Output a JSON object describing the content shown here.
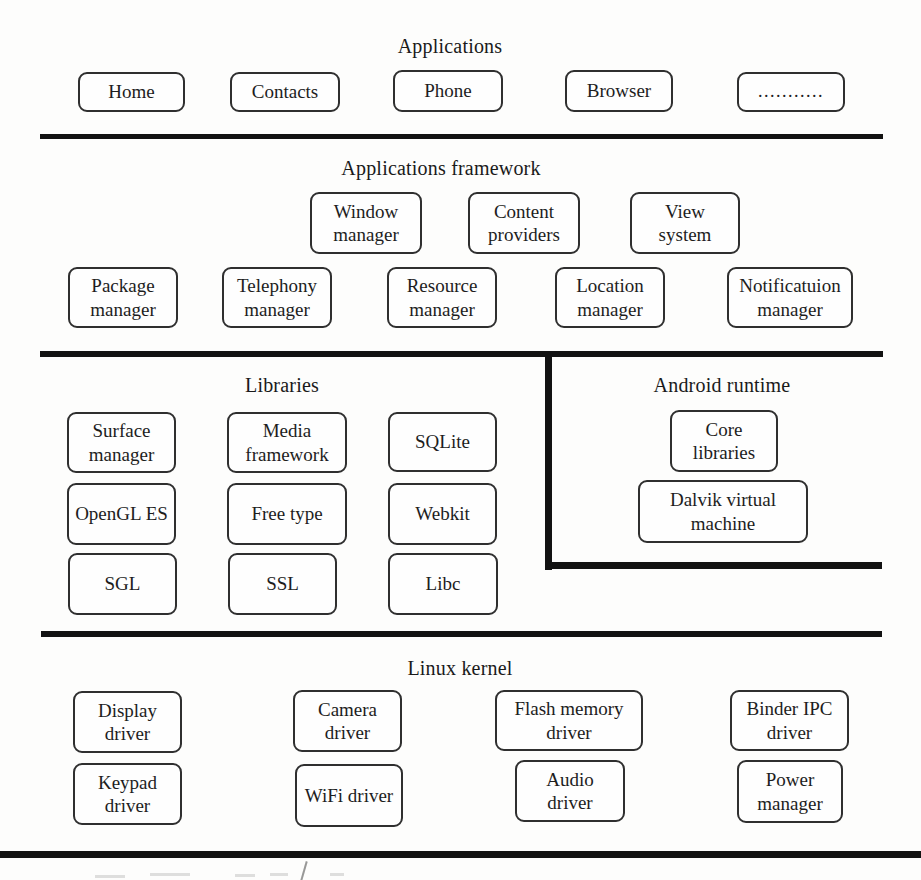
{
  "figure": {
    "type": "android-architecture-stack-diagram",
    "background_color": "#fdfdfc",
    "line_color": "#121212",
    "box_border_color": "#2f2f2f",
    "text_color": "#1d1d1d"
  },
  "sections": {
    "applications": {
      "title": "Applications",
      "boxes": [
        "Home",
        "Contacts",
        "Phone",
        "Browser",
        "..........."
      ]
    },
    "applications_framework": {
      "title": "Applications framework",
      "row1": [
        "Window manager",
        "Content providers",
        "View system"
      ],
      "row2": [
        "Package manager",
        "Telephony manager",
        "Resource manager",
        "Location manager",
        "Notificatuion manager"
      ]
    },
    "libraries": {
      "title": "Libraries",
      "row1": [
        "Surface manager",
        "Media framework",
        "SQLite"
      ],
      "row2": [
        "OpenGL ES",
        "Free type",
        "Webkit"
      ],
      "row3": [
        "SGL",
        "SSL",
        "Libc"
      ]
    },
    "android_runtime": {
      "title": "Android runtime",
      "boxes": [
        "Core libraries",
        "Dalvik virtual machine"
      ]
    },
    "linux_kernel": {
      "title": "Linux kernel",
      "row1": [
        "Display driver",
        "Camera driver",
        "Flash memory driver",
        "Binder IPC driver"
      ],
      "row2": [
        "Keypad driver",
        "WiFi driver",
        "Audio driver",
        "Power manager"
      ]
    }
  }
}
